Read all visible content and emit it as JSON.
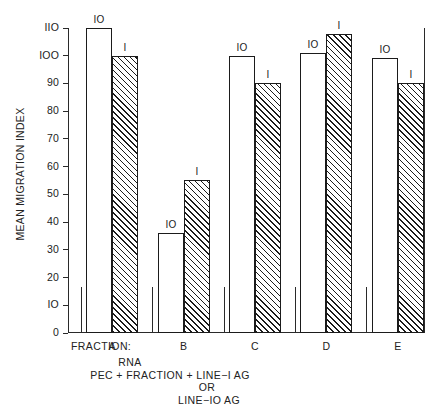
{
  "chart_data": {
    "type": "bar",
    "title": "",
    "xlabel": "FRACTION:",
    "ylabel": "MEAN MIGRATION INDEX",
    "ylim": [
      0,
      110
    ],
    "ytick_values": [
      0,
      10,
      20,
      30,
      40,
      50,
      60,
      70,
      80,
      90,
      100,
      110
    ],
    "ytick_labels": [
      "0",
      "IO",
      "20",
      "30",
      "40",
      "50",
      "60",
      "70",
      "80",
      "90",
      "IOO",
      "IIO"
    ],
    "grid": false,
    "legend_position": "above-bars",
    "categories": [
      "A",
      "B",
      "C",
      "D",
      "E"
    ],
    "series": [
      {
        "name": "IO",
        "style": "open",
        "values": [
          110,
          36,
          100,
          101,
          99
        ]
      },
      {
        "name": "I",
        "style": "hatched",
        "values": [
          100,
          55,
          90,
          108,
          90
        ]
      }
    ],
    "bar_labels": [
      [
        "IO",
        "I"
      ],
      [
        "IO",
        "I"
      ],
      [
        "IO",
        "I"
      ],
      [
        "IO",
        "I"
      ],
      [
        "IO",
        "I"
      ]
    ],
    "caption_lines": [
      "RNA",
      "PEC + FRACTION + LINE−I AG",
      "OR",
      "LINE−IO AG"
    ]
  }
}
